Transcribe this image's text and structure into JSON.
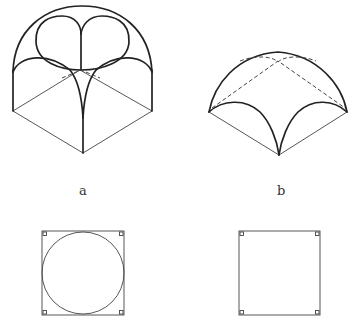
{
  "figures": [
    {
      "id": "a",
      "label": "a",
      "description": "Sail vault (domical vault on square bay) in axonometric view with circular plan",
      "plan": "square-with-inscribed-circle"
    },
    {
      "id": "b",
      "label": "b",
      "description": "Groin/sail vault segment in axonometric view with dashed hidden lines",
      "plan": "square"
    }
  ],
  "colors": {
    "stroke": "#222222",
    "background": "#ffffff"
  }
}
